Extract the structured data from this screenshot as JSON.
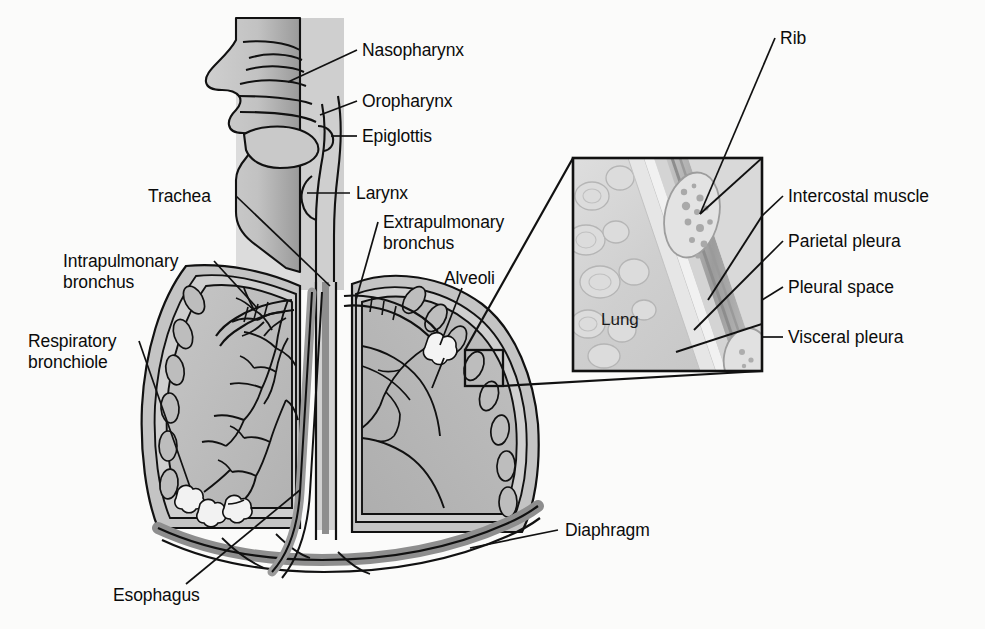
{
  "figure": {
    "colors": {
      "line": "#111111",
      "airway_fill": "#c9c9c9",
      "lung_fill": "#b9b9b9",
      "lung_fill_light": "#d2d2d2",
      "pleura_fill": "#a8a8a8",
      "diaphragm_fill": "#8f8f8f",
      "esophagus_fill": "#9a9a9a",
      "background": "#fbfbfa",
      "inset_background": "#d6d6d6",
      "text": "#0b0b0b"
    }
  },
  "labels": {
    "nasopharynx": "Nasopharynx",
    "oropharynx": "Oropharynx",
    "epiglottis": "Epiglottis",
    "larynx": "Larynx",
    "trachea": "Trachea",
    "extrapulmonary_bronchus_line1": "Extrapulmonary",
    "extrapulmonary_bronchus_line2": "bronchus",
    "intrapulmonary_bronchus_line1": "Intrapulmonary",
    "intrapulmonary_bronchus_line2": "bronchus",
    "alveoli": "Alveoli",
    "respiratory_bronchiole_line1": "Respiratory",
    "respiratory_bronchiole_line2": "bronchiole",
    "esophagus": "Esophagus",
    "diaphragm": "Diaphragm"
  },
  "inset": {
    "lung": "Lung",
    "rib": "Rib",
    "intercostal_muscle": "Intercostal muscle",
    "parietal_pleura": "Parietal pleura",
    "pleural_space": "Pleural space",
    "visceral_pleura": "Visceral pleura"
  }
}
